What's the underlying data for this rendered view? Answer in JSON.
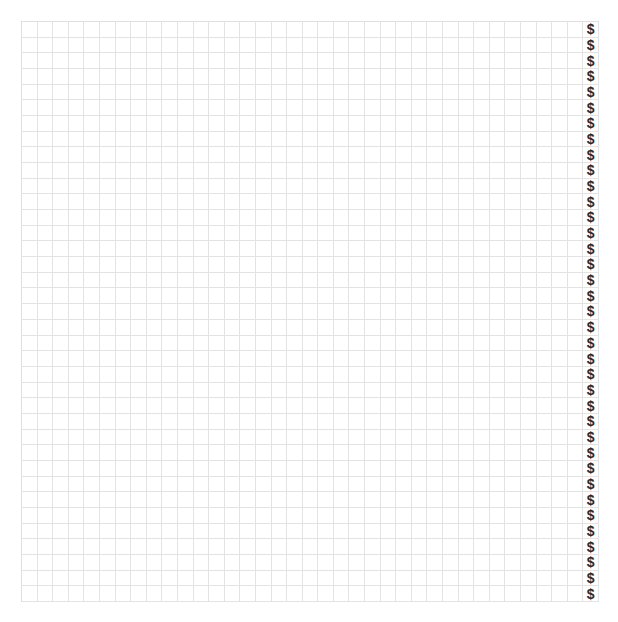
{
  "header": {
    "clipped_text": ""
  },
  "grid": {
    "rows": 37,
    "columns": 37,
    "line_color": "#e3e3e3",
    "background": "#ffffff",
    "symbol_column_index": 36,
    "symbol": "$",
    "symbol_color": "#2a2a2a",
    "cells": []
  }
}
